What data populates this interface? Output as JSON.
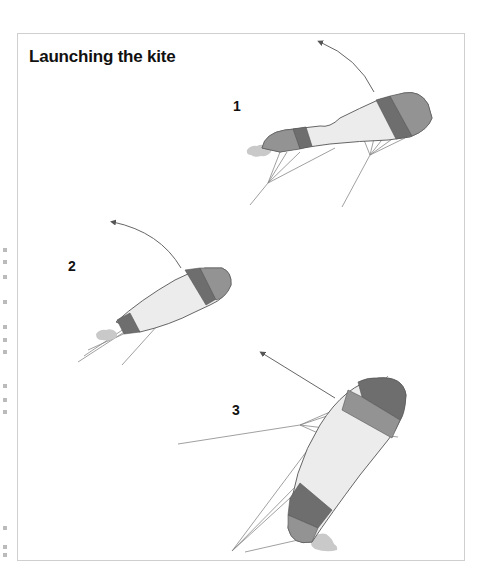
{
  "figure": {
    "title": "Launching the kite",
    "steps": [
      {
        "label": "1",
        "description": "Kite lying on its side at edge of wind window; arrow shows it rising upward"
      },
      {
        "label": "2",
        "description": "Kite partially lifted, leading edge angled up; arrow shows it continuing upward"
      },
      {
        "label": "3",
        "description": "Kite standing upright, lines taut; arrow shows direction of launch"
      }
    ]
  },
  "colors": {
    "outline": "#555555",
    "canopy": "#ececec",
    "band_dark": "#6e6e6e",
    "band_mid": "#939393",
    "sand": "#c9c9c9",
    "lines": "#777777",
    "frame_border": "#cfcfcf"
  }
}
